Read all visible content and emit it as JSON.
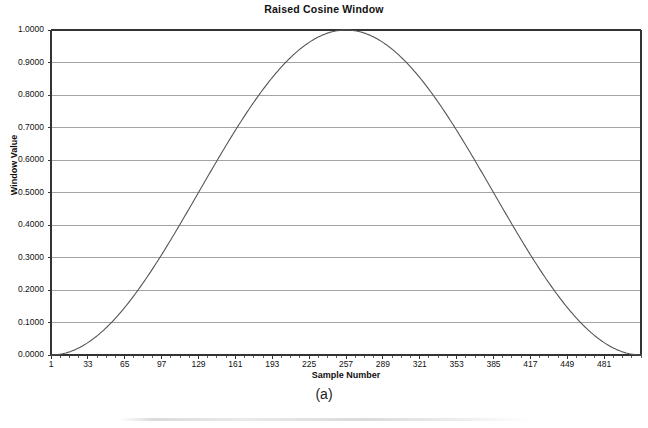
{
  "figure": {
    "caption": "(a)"
  },
  "chart_data": {
    "type": "line",
    "title": "Raised Cosine Window",
    "xlabel": "Sample Number",
    "ylabel": "Window Value",
    "grid": true,
    "legend": "none",
    "xlim": [
      1,
      513
    ],
    "ylim": [
      0.0,
      1.0
    ],
    "xticks": [
      1,
      33,
      65,
      97,
      129,
      161,
      193,
      225,
      257,
      289,
      321,
      353,
      385,
      417,
      449,
      481
    ],
    "xtick_labels": [
      "1",
      "33",
      "65",
      "97",
      "129",
      "161",
      "193",
      "225",
      "257",
      "289",
      "321",
      "353",
      "385",
      "417",
      "449",
      "481"
    ],
    "xtick_minor_step": 8,
    "yticks": [
      0.0,
      0.1,
      0.2,
      0.3,
      0.4,
      0.5,
      0.6,
      0.7,
      0.8,
      0.9,
      1.0
    ],
    "ytick_labels": [
      "0.0000",
      "0.1000",
      "0.2000",
      "0.3000",
      "0.4000",
      "0.5000",
      "0.6000",
      "0.7000",
      "0.8000",
      "0.9000",
      "1.0000"
    ],
    "series": [
      {
        "name": "Raised Cosine Window",
        "formula": "0.5 * (1 - cos(2*pi*(n-1)/512))",
        "color": "#555555",
        "x": [
          1,
          17,
          33,
          49,
          65,
          81,
          97,
          113,
          129,
          145,
          161,
          177,
          193,
          209,
          225,
          241,
          257,
          273,
          289,
          305,
          321,
          337,
          353,
          369,
          385,
          401,
          417,
          433,
          449,
          465,
          481,
          497,
          513
        ],
        "values": [
          0.0,
          0.0096,
          0.0381,
          0.0843,
          0.1464,
          0.2222,
          0.3087,
          0.4025,
          0.5,
          0.5975,
          0.6913,
          0.7778,
          0.8536,
          0.9157,
          0.9619,
          0.9904,
          1.0,
          0.9904,
          0.9619,
          0.9157,
          0.8536,
          0.7778,
          0.6913,
          0.5975,
          0.5,
          0.4025,
          0.3087,
          0.2222,
          0.1464,
          0.0843,
          0.0381,
          0.0096,
          0.0
        ]
      }
    ],
    "colors": {
      "curve": "#555555",
      "gridline": "#999999",
      "axis": "#333333",
      "background": "#ffffff"
    }
  }
}
